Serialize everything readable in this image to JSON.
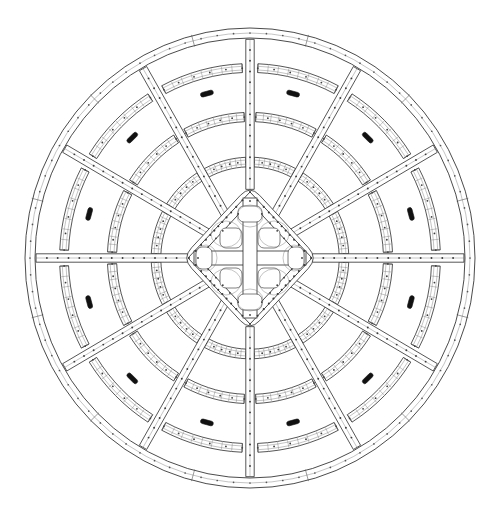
{
  "drawing": {
    "title": "Circular Radial Framework Assembly Plan",
    "view_label": "plan-view",
    "line_color": "#2b2b2b",
    "background_color": "#ffffff",
    "marker_color": "#111111",
    "canvas": {
      "width": 500,
      "height": 516
    }
  },
  "geometry": {
    "center": {
      "x": 250,
      "y": 258
    },
    "outer_radius_x": 225,
    "outer_radius_y": 230,
    "rim": {
      "name": "outer-rim",
      "band_outer_rx": 225,
      "band_outer_ry": 230,
      "band_inner_rx": 215,
      "band_inner_ry": 220,
      "segments": 12,
      "rivets_per_segment": 7
    },
    "spoke_count": 12,
    "spoke_start_angle_deg": -90,
    "spoke_angles_deg": [
      -90,
      -60,
      -30,
      0,
      30,
      60,
      90,
      120,
      150,
      180,
      210,
      240
    ],
    "spoke_half_width": 4.2,
    "rings": [
      {
        "name": "ring-1-outer",
        "rx": 215,
        "ry": 220,
        "lattice": false,
        "arc_half_width": 4.0
      },
      {
        "name": "ring-2",
        "rx": 186,
        "ry": 190,
        "lattice": true,
        "arc_half_width": 4.4
      },
      {
        "name": "ring-3",
        "rx": 138,
        "ry": 141,
        "lattice": true,
        "arc_half_width": 4.6
      },
      {
        "name": "ring-4-inner",
        "rx": 94,
        "ry": 96,
        "lattice": true,
        "arc_half_width": 4.8
      }
    ],
    "hub": {
      "name": "center-hub",
      "shape": "rounded-diamond",
      "half_diagonal_x": 68,
      "half_diagonal_y": 73,
      "inner_half_diagonal_x": 52,
      "inner_half_diagonal_y": 56,
      "corner_radius": 14,
      "cross_beam_half_width": 7,
      "pocket_count": 8,
      "rivet_ring_count": 48
    },
    "markers": {
      "name": "fitting-markers",
      "count": 12,
      "radius_fraction": 0.74,
      "length": 13,
      "width": 4.6,
      "description": "solid black rounded bar fittings on alternating spokes"
    }
  },
  "legend": {
    "line_weight_primary": "0.85",
    "line_weight_secondary": "0.55",
    "line_weight_hairline": "0.4"
  }
}
